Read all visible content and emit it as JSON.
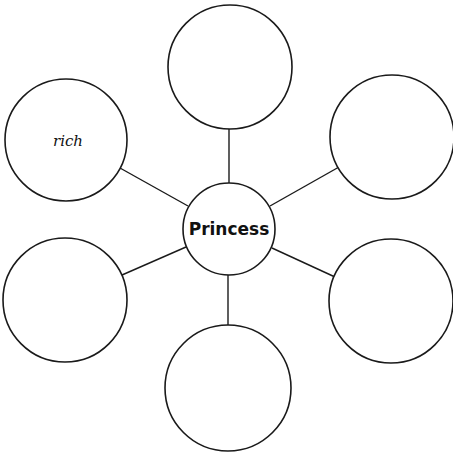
{
  "diagram": {
    "type": "bubble-map",
    "center": {
      "label": "Princess"
    },
    "nodes": [
      {
        "position": "top",
        "label": ""
      },
      {
        "position": "top-right",
        "label": ""
      },
      {
        "position": "bottom-right",
        "label": ""
      },
      {
        "position": "bottom",
        "label": ""
      },
      {
        "position": "bottom-left",
        "label": ""
      },
      {
        "position": "top-left",
        "label": "rich"
      }
    ]
  }
}
